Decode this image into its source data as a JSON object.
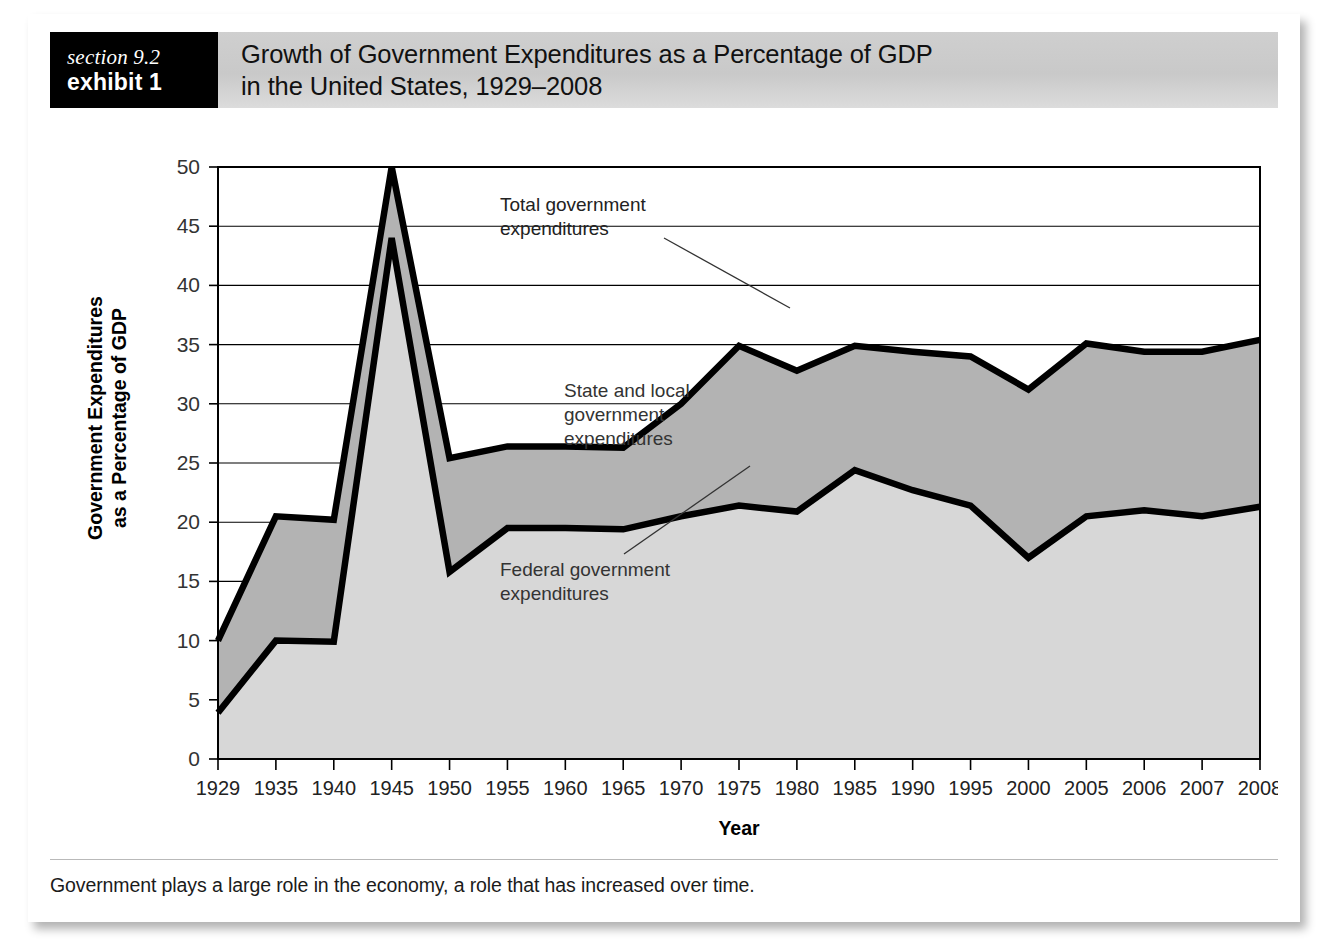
{
  "header": {
    "section_label": "section 9.2",
    "exhibit_label": "exhibit 1",
    "title_line1": "Growth of Government Expenditures as a Percentage of GDP",
    "title_line2": "in the United States, 1929–2008"
  },
  "caption": "Government plays a large role in the economy, a role that has increased over time.",
  "colors": {
    "header_band": "#cbcbcb",
    "section_block": "#000000",
    "total_area_fill": "#b3b3b3",
    "federal_area_fill": "#d7d7d7",
    "line_stroke": "#000000",
    "gridline": "#000000",
    "page_background": "#ffffff"
  },
  "chart_data": {
    "type": "area",
    "title": "Growth of Government Expenditures as a Percentage of GDP in the United States, 1929–2008",
    "xlabel": "Year",
    "ylabel": "Government Expenditures as a Percentage of GDP",
    "grid": true,
    "legend_position": "annotations-inline",
    "xlim": [
      0,
      18
    ],
    "ylim": [
      0,
      50
    ],
    "yticks": [
      0,
      5,
      10,
      15,
      20,
      25,
      30,
      35,
      40,
      45,
      50
    ],
    "categories": [
      "1929",
      "1935",
      "1940",
      "1945",
      "1950",
      "1955",
      "1960",
      "1965",
      "1970",
      "1975",
      "1980",
      "1985",
      "1990",
      "1995",
      "2000",
      "2005",
      "2006",
      "2007",
      "2008"
    ],
    "series": [
      {
        "name": "Total government expenditures",
        "values": [
          10.0,
          20.5,
          20.2,
          50.0,
          25.4,
          26.4,
          26.4,
          26.3,
          30.0,
          34.9,
          32.8,
          34.9,
          34.4,
          34.0,
          31.2,
          35.1,
          34.4,
          34.4,
          35.4
        ]
      },
      {
        "name": "Federal government expenditures",
        "values": [
          3.9,
          10.0,
          9.9,
          44.0,
          15.8,
          19.5,
          19.5,
          19.4,
          20.5,
          21.4,
          20.9,
          24.4,
          22.7,
          21.4,
          17.0,
          20.5,
          21.0,
          20.5,
          21.3
        ]
      }
    ],
    "annotations": [
      {
        "id": "total",
        "text_lines": [
          "Total government",
          "expenditures"
        ]
      },
      {
        "id": "state-local",
        "text_lines": [
          "State and local",
          "government",
          "expenditures"
        ]
      },
      {
        "id": "federal",
        "text_lines": [
          "Federal government",
          "expenditures"
        ]
      }
    ]
  }
}
